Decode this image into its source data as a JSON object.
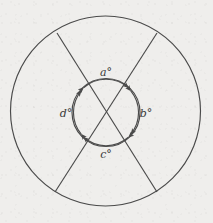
{
  "figure": {
    "name": "two-concentric-circles-with-crossing-chords",
    "background_color": "#efeeec",
    "stroke_color": "#4a4a4a",
    "label_color": "#3a3a3a"
  },
  "labels": {
    "top": {
      "symbol": "a",
      "unit": "°",
      "full": "a°"
    },
    "right": {
      "symbol": "b",
      "unit": "°",
      "full": "b°"
    },
    "bottom": {
      "symbol": "c",
      "unit": "°",
      "full": "c°"
    },
    "left": {
      "symbol": "d",
      "unit": "°",
      "full": "d°"
    }
  },
  "geometry": {
    "outer_circle": {
      "cx": 105.5,
      "cy": 111,
      "r": 95
    },
    "inner_circle": {
      "cx": 106,
      "cy": 112.5,
      "r": 34
    },
    "line_1": {
      "x1": 57,
      "y1": 33,
      "x2": 157,
      "y2": 192
    },
    "line_2": {
      "x1": 157,
      "y1": 33,
      "x2": 55,
      "y2": 192
    }
  }
}
